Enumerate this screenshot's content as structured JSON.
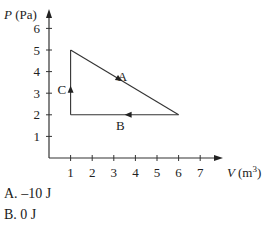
{
  "chart_data": {
    "type": "line",
    "title": "",
    "xlabel_var": "V",
    "xlabel_unit": "(m",
    "xlabel_sup": "3",
    "xlabel_close": ")",
    "ylabel_var": "P",
    "ylabel_unit": " (Pa)",
    "xlim": [
      0,
      7.8
    ],
    "ylim": [
      0,
      6.6
    ],
    "xticks": [
      1,
      2,
      3,
      4,
      5,
      6,
      7
    ],
    "yticks": [
      1,
      2,
      3,
      4,
      5,
      6
    ],
    "grid": false,
    "series": [
      {
        "name": "A",
        "x": [
          1,
          6
        ],
        "y": [
          5,
          2
        ],
        "direction": "from (1,5) to (6,2)"
      },
      {
        "name": "B",
        "x": [
          6,
          1
        ],
        "y": [
          2,
          2
        ],
        "direction": "from (6,2) to (1,2)"
      },
      {
        "name": "C",
        "x": [
          1,
          1
        ],
        "y": [
          2,
          5
        ],
        "direction": "from (1,2) to (1,5)"
      }
    ],
    "annotations": [
      {
        "text": "A",
        "x": 3.4,
        "y": 3.8
      },
      {
        "text": "B",
        "x": 3.3,
        "y": 1.55
      },
      {
        "text": "C",
        "x": 0.6,
        "y": 3.2
      }
    ]
  },
  "answers": [
    {
      "letter": "A.",
      "text": " –10 J"
    },
    {
      "letter": "B.",
      "text": " 0 J"
    }
  ]
}
